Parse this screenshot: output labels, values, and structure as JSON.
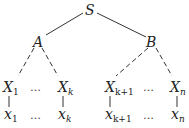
{
  "diagram": {
    "type": "parse-tree",
    "root": {
      "label": "S"
    },
    "internal": [
      {
        "label": "A",
        "parent": "S"
      },
      {
        "label": "B",
        "parent": "S"
      }
    ],
    "level2": [
      {
        "base": "X",
        "sub": "1",
        "parent": "A",
        "edge": "dashed"
      },
      {
        "base": "X",
        "sub": "k",
        "parent": "A",
        "edge": "dashed"
      },
      {
        "base": "X",
        "sub": "k+1",
        "parent": "B",
        "edge": "dashed"
      },
      {
        "base": "X",
        "sub": "n",
        "parent": "B",
        "edge": "dashed"
      }
    ],
    "leaves": [
      {
        "base": "x",
        "sub": "1"
      },
      {
        "base": "x",
        "sub": "k"
      },
      {
        "base": "x",
        "sub": "k+1"
      },
      {
        "base": "x",
        "sub": "n"
      }
    ],
    "ellipsis": "…",
    "edge_color": "#333333"
  }
}
